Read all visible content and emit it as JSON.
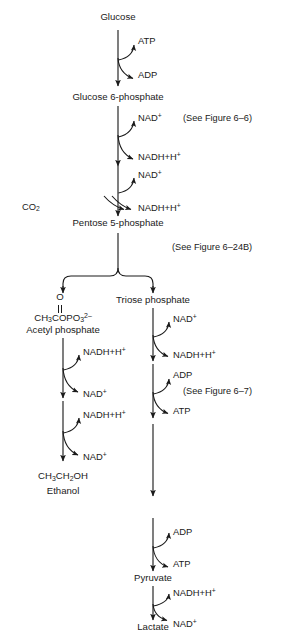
{
  "figure": {
    "type": "metabolic-pathway-diagram"
  },
  "metabolites": [
    {
      "id": "glucose",
      "label": "Glucose",
      "x": 118,
      "y": 18
    },
    {
      "id": "glucose6p",
      "label": "Glucose 6-phosphate",
      "x": 118,
      "y": 98
    },
    {
      "id": "pentose5p",
      "label": "Pentose 5-phosphate",
      "x": 118,
      "y": 224
    },
    {
      "id": "acetylphos",
      "label": "Acetyl phosphate",
      "x": 63,
      "y": 330
    },
    {
      "id": "triosephos",
      "label": "Triose phosphate",
      "x": 153,
      "y": 300
    },
    {
      "id": "ethanol",
      "label": "Ethanol",
      "x": 63,
      "y": 491
    },
    {
      "id": "pyruvate",
      "label": "Pyruvate",
      "x": 153,
      "y": 578
    },
    {
      "id": "lactate",
      "label": "Lactate",
      "x": 153,
      "y": 627
    }
  ],
  "formulas": {
    "acetyl_phosphate_oxygen": "O",
    "acetyl_phosphate_bond": "||",
    "acetyl_phosphate": {
      "pre": "CH",
      "sub1": "3",
      "mid": "COPO",
      "sub2": "3",
      "charge": "2–"
    },
    "ethanol": {
      "p1": "CH",
      "s1": "3",
      "p2": "CH",
      "s2": "2",
      "p3": "OH"
    }
  },
  "cofactors": [
    {
      "id": "atp-in-1",
      "label": "ATP",
      "x": 138,
      "y": 42,
      "role": "substrate"
    },
    {
      "id": "adp-out-1",
      "label": "ADP",
      "x": 138,
      "y": 76,
      "role": "product"
    },
    {
      "id": "nad-in-1",
      "label": "NAD",
      "sup": "+",
      "x": 138,
      "y": 118,
      "role": "substrate"
    },
    {
      "id": "nadh-out-1",
      "label": "NADH+H",
      "sup": "+",
      "x": 138,
      "y": 157,
      "role": "product"
    },
    {
      "id": "nad-in-2",
      "label": "NAD",
      "sup": "+",
      "x": 138,
      "y": 175,
      "role": "substrate"
    },
    {
      "id": "nadh-out-2",
      "label": "NADH+H",
      "sup": "+",
      "x": 138,
      "y": 208,
      "role": "product"
    },
    {
      "id": "co2-out",
      "label": "CO",
      "sub": "2",
      "x": 35,
      "y": 208,
      "role": "product"
    },
    {
      "id": "nad-in-3",
      "label": "NAD",
      "sup": "+",
      "x": 173,
      "y": 319,
      "role": "substrate"
    },
    {
      "id": "nadh-out-3",
      "label": "NADH+H",
      "sup": "+",
      "x": 173,
      "y": 355,
      "role": "product"
    },
    {
      "id": "adp-in-2",
      "label": "ADP",
      "x": 173,
      "y": 376,
      "role": "substrate"
    },
    {
      "id": "atp-out-2",
      "label": "ATP",
      "x": 173,
      "y": 412,
      "role": "product"
    },
    {
      "id": "nadh-in-l1",
      "label": "NADH+H",
      "sup": "+",
      "x": 83,
      "y": 352,
      "role": "substrate"
    },
    {
      "id": "nad-out-l1",
      "label": "NAD",
      "sup": "+",
      "x": 83,
      "y": 394,
      "role": "product"
    },
    {
      "id": "nadh-in-l2",
      "label": "NADH+H",
      "sup": "+",
      "x": 83,
      "y": 415,
      "role": "substrate"
    },
    {
      "id": "nad-out-l2",
      "label": "NAD",
      "sup": "+",
      "x": 83,
      "y": 457,
      "role": "product"
    },
    {
      "id": "adp-in-3",
      "label": "ADP",
      "x": 173,
      "y": 533,
      "role": "substrate"
    },
    {
      "id": "atp-out-3",
      "label": "ATP",
      "x": 173,
      "y": 565,
      "role": "product"
    },
    {
      "id": "nadh-in-lac",
      "label": "NADH+H",
      "sup": "+",
      "x": 173,
      "y": 593,
      "role": "substrate"
    },
    {
      "id": "nad-out-lac",
      "label": "NAD",
      "sup": "+",
      "x": 173,
      "y": 624,
      "role": "product"
    }
  ],
  "references": [
    {
      "id": "ref-6-6",
      "label": "(See Figure 6–6)",
      "x": 183,
      "y": 119
    },
    {
      "id": "ref-6-24b",
      "label": "(See Figure 6–24B)",
      "x": 172,
      "y": 248
    },
    {
      "id": "ref-6-7",
      "label": "(See Figure 6–7)",
      "x": 183,
      "y": 392
    }
  ],
  "style": {
    "stroke": "#1a1a1a",
    "background": "#ffffff"
  }
}
